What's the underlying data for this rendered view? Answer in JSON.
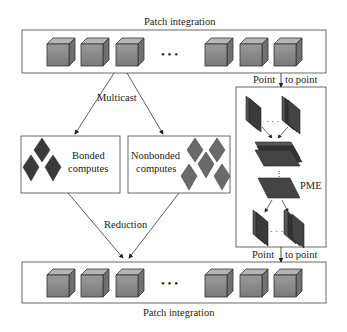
{
  "top_stage": {
    "title": "Patch integration",
    "ellipsis": "• • •"
  },
  "bottom_stage": {
    "title": "Patch integration",
    "ellipsis": "• • •"
  },
  "edges": {
    "multicast": "Multicast",
    "reduction": "Reduction",
    "point_to_point_top": {
      "left": "Point",
      "right": "to point"
    },
    "point_to_point_bottom": {
      "left": "Point",
      "right": "to point"
    }
  },
  "bonded": {
    "line1": "Bonded",
    "line2": "computes"
  },
  "nonbonded": {
    "line1": "Nonbonded",
    "line2": "computes"
  },
  "pme": {
    "label": "PME"
  },
  "colors": {
    "cube_front": "#8a8a8a",
    "cube_top": "#b0b0b0",
    "cube_side": "#6e6e6e",
    "bonded_diamond": "#3a3a3a",
    "nonbonded_diamond": "#6a6a6a",
    "plane": "#333333",
    "stroke": "#333333"
  }
}
